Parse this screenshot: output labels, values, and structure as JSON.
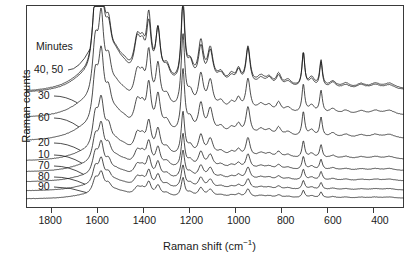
{
  "chart_data": {
    "type": "line",
    "title": "",
    "xlabel": "Raman shift (cm−1)",
    "ylabel": "Raman counts",
    "xlim": [
      1900,
      300
    ],
    "x_reversed": true,
    "xticks": [
      1800,
      1600,
      1400,
      1200,
      1000,
      800,
      600,
      400
    ],
    "xticklabels": [
      "1800",
      "1600",
      "1400",
      "1200",
      "1000",
      "800",
      "600",
      "400"
    ],
    "yticks": [],
    "yticklabels": [],
    "grid": false,
    "legend_position": "inside-left-stacked-labels",
    "legend_header": "Minutes",
    "series": [
      {
        "name": "40, 50",
        "label": "40, 50",
        "offset_index": 0,
        "color": "#111111",
        "note": "two overlapping traces drawn together, topmost"
      },
      {
        "name": "30",
        "label": "30",
        "offset_index": 1,
        "color": "#111111"
      },
      {
        "name": "60",
        "label": "60",
        "offset_index": 2,
        "color": "#111111"
      },
      {
        "name": "20",
        "label": "20",
        "offset_index": 3,
        "color": "#111111"
      },
      {
        "name": "10",
        "label": "10",
        "offset_index": 4,
        "color": "#111111"
      },
      {
        "name": "70",
        "label": "70",
        "offset_index": 5,
        "color": "#111111"
      },
      {
        "name": "80",
        "label": "80",
        "offset_index": 6,
        "color": "#111111"
      },
      {
        "name": "90",
        "label": "90",
        "offset_index": 7,
        "color": "#111111"
      }
    ],
    "peaks_cm1": [
      1605,
      1580,
      1430,
      1380,
      1340,
      1235,
      1160,
      1120,
      1000,
      960,
      830,
      725,
      650
    ],
    "peak_relative_intensity": [
      0.78,
      1.0,
      0.42,
      0.66,
      0.58,
      0.95,
      0.44,
      0.38,
      0.18,
      0.44,
      0.12,
      0.4,
      0.3
    ],
    "annotation": "Spectra are vertically offset by reaction time in minutes; intensity decreases downward in the stack."
  },
  "axes": {
    "xticklabels": [
      "1800",
      "1600",
      "1400",
      "1200",
      "1000",
      "800",
      "600",
      "400"
    ],
    "xlabel_main": "Raman shift (cm",
    "xlabel_sup": "−1",
    "xlabel_tail": ")",
    "ylabel": "Raman counts"
  },
  "labels": {
    "header": "Minutes",
    "series": [
      "40, 50",
      "30",
      "60",
      "20",
      "10",
      "70",
      "80",
      "90"
    ]
  }
}
